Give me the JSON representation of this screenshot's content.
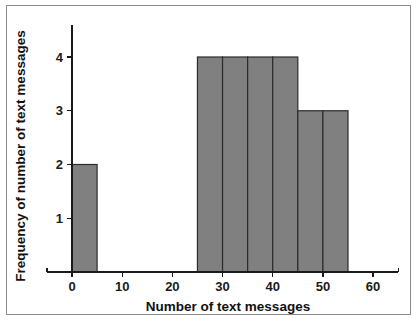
{
  "chart_data": {
    "type": "bar",
    "title": "",
    "subtitle": "",
    "xlabel": "Number of text messages",
    "ylabel": "Frequency of number of text messages",
    "xlim": [
      -5,
      65
    ],
    "ylim": [
      0,
      4.6
    ],
    "xticks": [
      0,
      10,
      20,
      30,
      40,
      50,
      60
    ],
    "xtick_labels": [
      "0",
      "10",
      "20",
      "30",
      "40",
      "50",
      "60"
    ],
    "yticks": [
      1,
      2,
      3,
      4
    ],
    "ytick_labels": [
      "1",
      "2",
      "3",
      "4"
    ],
    "grid": false,
    "legend": false,
    "bin_width": 5,
    "categories": [
      "0-5",
      "5-10",
      "10-15",
      "15-20",
      "20-25",
      "25-30",
      "30-35",
      "35-40",
      "40-45",
      "45-50",
      "50-55"
    ],
    "values": [
      2,
      0,
      0,
      0,
      0,
      4,
      4,
      4,
      4,
      3,
      3
    ],
    "bars": [
      {
        "bin_start": 0,
        "bin_end": 5,
        "value": 2
      },
      {
        "bin_start": 25,
        "bin_end": 30,
        "value": 4
      },
      {
        "bin_start": 30,
        "bin_end": 35,
        "value": 4
      },
      {
        "bin_start": 35,
        "bin_end": 40,
        "value": 4
      },
      {
        "bin_start": 40,
        "bin_end": 45,
        "value": 4
      },
      {
        "bin_start": 45,
        "bin_end": 50,
        "value": 3
      },
      {
        "bin_start": 50,
        "bin_end": 55,
        "value": 3
      }
    ],
    "colors": {
      "bar_fill": "#808080",
      "bar_stroke": "#2b2b2b",
      "axis": "#1a1a1a",
      "background": "#ffffff",
      "frame": "#8a8a8a"
    }
  }
}
